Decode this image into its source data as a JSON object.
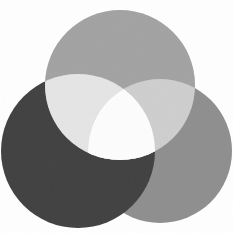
{
  "diagram": {
    "type": "three-circle-venn",
    "background": "#ffffff",
    "regions": {
      "top_circle": "#a2a2a2",
      "bottom_left_circle": "#414141",
      "bottom_right_circle": "#8e8e8e",
      "overlap_top_left": "#e5e5e5",
      "overlap_top_right": "#cecece",
      "overlap_bottom_left_right": "#414141",
      "center": "#fdfdfd"
    }
  }
}
